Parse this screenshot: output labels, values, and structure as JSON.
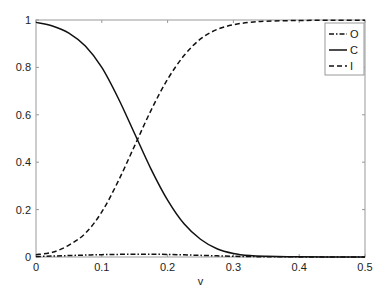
{
  "chart_data": {
    "type": "line",
    "title": "",
    "xlabel": "v",
    "ylabel": "",
    "xlim": [
      0,
      0.5
    ],
    "ylim": [
      0,
      1
    ],
    "grid": false,
    "legend_position": "upper right (inside)",
    "x_ticks": [
      0,
      0.1,
      0.2,
      0.3,
      0.4,
      0.5
    ],
    "x_tick_labels": [
      "0",
      "0.1",
      "0.2",
      "0.3",
      "0.4",
      "0.5"
    ],
    "y_ticks": [
      0,
      0.2,
      0.4,
      0.6,
      0.8,
      1
    ],
    "y_tick_labels": [
      "0",
      "0.2",
      "0.4",
      "0.6",
      "0.8",
      "1"
    ],
    "x": [
      0,
      0.025,
      0.05,
      0.075,
      0.1,
      0.125,
      0.15,
      0.175,
      0.2,
      0.225,
      0.25,
      0.275,
      0.3,
      0.325,
      0.35,
      0.4,
      0.45,
      0.5
    ],
    "series": [
      {
        "name": "O",
        "line_style": "dash-dot",
        "values": [
          0.002,
          0.004,
          0.006,
          0.008,
          0.01,
          0.011,
          0.012,
          0.012,
          0.011,
          0.009,
          0.007,
          0.005,
          0.003,
          0.002,
          0.001,
          0.0005,
          0.0002,
          0.0001
        ]
      },
      {
        "name": "C",
        "line_style": "solid",
        "values": [
          0.99,
          0.975,
          0.945,
          0.89,
          0.8,
          0.67,
          0.52,
          0.37,
          0.24,
          0.14,
          0.075,
          0.035,
          0.015,
          0.006,
          0.003,
          0.001,
          0.0003,
          0.0001
        ]
      },
      {
        "name": "I",
        "line_style": "dashed",
        "values": [
          0.01,
          0.02,
          0.05,
          0.1,
          0.19,
          0.32,
          0.47,
          0.62,
          0.75,
          0.85,
          0.92,
          0.96,
          0.98,
          0.99,
          0.995,
          0.998,
          0.999,
          0.999
        ]
      }
    ]
  },
  "legend": {
    "items": [
      {
        "label": "O",
        "style": "dash-dot"
      },
      {
        "label": "C",
        "style": "solid"
      },
      {
        "label": "I",
        "style": "dashed"
      }
    ]
  },
  "colors": {
    "line": "#111111",
    "axis": "#999999",
    "text": "#222222"
  }
}
